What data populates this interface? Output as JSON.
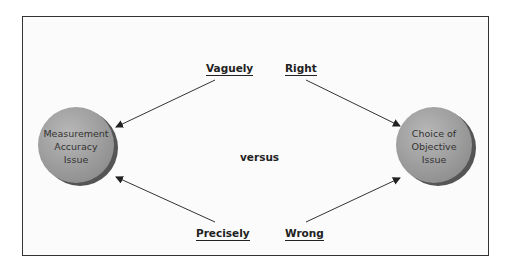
{
  "diagram": {
    "nodes": [
      {
        "id": "left",
        "label_lines": [
          "Measurement",
          "Accuracy",
          "Issue"
        ]
      },
      {
        "id": "right",
        "label_lines": [
          "Choice of",
          "Objective",
          "Issue"
        ]
      }
    ],
    "labels": {
      "top_left": "Vaguely",
      "top_right": "Right",
      "bottom_left": "Precisely",
      "bottom_right": "Wrong",
      "center": "versus"
    },
    "edges": [
      {
        "from": "Vaguely",
        "to": "Measurement Accuracy Issue"
      },
      {
        "from": "Precisely",
        "to": "Measurement Accuracy Issue"
      },
      {
        "from": "Right",
        "to": "Choice of Objective Issue"
      },
      {
        "from": "Wrong",
        "to": "Choice of Objective Issue"
      }
    ],
    "colors": {
      "node_fill": "#9a9a9a",
      "node_shadow": "#555555",
      "line": "#333333"
    }
  }
}
